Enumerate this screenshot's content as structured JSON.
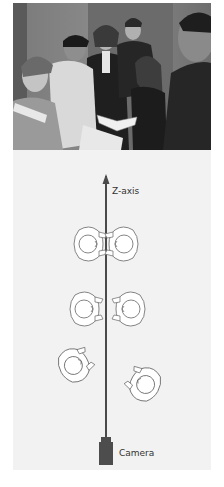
{
  "photo": {
    "description": "Black-and-white photo of a group of six people standing and looking at an open book",
    "people_count": 6
  },
  "diagram": {
    "axis_label": "Z-axis",
    "camera_label": "Camera",
    "figures": [
      {
        "id": "pair-top-left",
        "facing": "right"
      },
      {
        "id": "pair-top-right",
        "facing": "left"
      },
      {
        "id": "middle-left",
        "facing": "right"
      },
      {
        "id": "middle-right",
        "facing": "left"
      },
      {
        "id": "bottom-left",
        "facing": "up-right"
      },
      {
        "id": "bottom-right",
        "facing": "up-left"
      }
    ],
    "colors": {
      "axis": "#4a4a4a",
      "camera": "#4d4d4d",
      "figure_stroke": "#666666",
      "figure_fill": "#ffffff",
      "panel_bg": "#f2f2f2"
    }
  }
}
